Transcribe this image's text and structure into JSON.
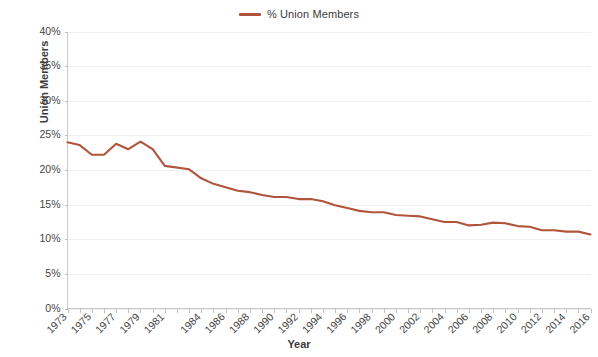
{
  "legend": {
    "position": "top-center",
    "entries": [
      {
        "label": "% Union Members",
        "color": "#b0543c",
        "marker": "line"
      }
    ]
  },
  "axes": {
    "y_title": "Union Members",
    "x_title": "Year"
  },
  "chart_data": {
    "type": "line",
    "title": "",
    "subtitle": "",
    "xlabel": "Year",
    "ylabel": "Union Members",
    "grid": true,
    "legend_position": "top-center",
    "series_color": "#b0543c",
    "ylim": [
      0,
      40
    ],
    "ytick_labels": [
      "0%",
      "5%",
      "10%",
      "15%",
      "20%",
      "25%",
      "30%",
      "35%",
      "40%"
    ],
    "ytick_values": [
      0,
      5,
      10,
      15,
      20,
      25,
      30,
      35,
      40
    ],
    "xtick_labels": [
      "1973",
      "1975",
      "1977",
      "1979",
      "1981",
      "1984",
      "1986",
      "1988",
      "1990",
      "1992",
      "1994",
      "1996",
      "1998",
      "2000",
      "2002",
      "2004",
      "2006",
      "2008",
      "2010",
      "2012",
      "2014",
      "2016"
    ],
    "x": [
      1973,
      1974,
      1975,
      1976,
      1977,
      1978,
      1979,
      1980,
      1981,
      1983,
      1984,
      1985,
      1986,
      1987,
      1988,
      1989,
      1990,
      1991,
      1992,
      1993,
      1994,
      1995,
      1996,
      1997,
      1998,
      1999,
      2000,
      2001,
      2002,
      2003,
      2004,
      2005,
      2006,
      2007,
      2008,
      2009,
      2010,
      2011,
      2012,
      2013,
      2014,
      2015,
      2016
    ],
    "series": [
      {
        "name": "% Union Members",
        "color": "#b0543c",
        "values": [
          24.0,
          23.6,
          22.2,
          22.2,
          23.8,
          23.0,
          24.1,
          23.0,
          20.6,
          20.1,
          18.8,
          18.0,
          17.5,
          17.0,
          16.8,
          16.4,
          16.1,
          16.1,
          15.8,
          15.8,
          15.5,
          14.9,
          14.5,
          14.1,
          13.9,
          13.9,
          13.5,
          13.4,
          13.3,
          12.9,
          12.5,
          12.5,
          12.0,
          12.1,
          12.4,
          12.3,
          11.9,
          11.8,
          11.3,
          11.3,
          11.1,
          11.1,
          10.7
        ]
      }
    ]
  }
}
